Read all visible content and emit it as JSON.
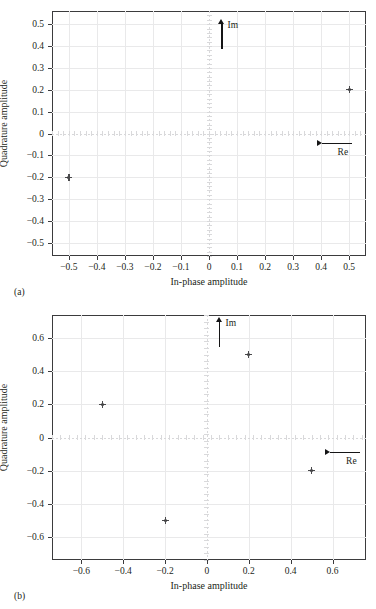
{
  "page": {
    "background": "#ffffff",
    "ink": "#231f20",
    "grid_color": "#e9e9ea",
    "frame_color": "#3b3b3d",
    "marker_color": "#4a4a4c",
    "arrow_color": "#151516"
  },
  "panels": [
    {
      "id": "a",
      "caption": "(a)",
      "xlabel": "In-phase amplitude",
      "ylabel": "Quadrature amplitude",
      "annotations": [
        {
          "label": "Im",
          "direction": "up"
        },
        {
          "label": "Re",
          "direction": "right"
        }
      ]
    },
    {
      "id": "b",
      "caption": "(b)",
      "xlabel": "In-phase amplitude",
      "ylabel": "Quadrature amplitude",
      "annotations": [
        {
          "label": "Im",
          "direction": "up"
        },
        {
          "label": "Re",
          "direction": "right"
        }
      ]
    }
  ],
  "chart_data": [
    {
      "type": "scatter",
      "panel": "a",
      "title": "",
      "xlabel": "In-phase amplitude",
      "ylabel": "Quadrature amplitude",
      "xlim": [
        -0.56,
        0.56
      ],
      "ylim": [
        -0.56,
        0.56
      ],
      "xticks": [
        -0.5,
        -0.4,
        -0.3,
        -0.2,
        -0.1,
        0,
        0.1,
        0.2,
        0.3,
        0.4,
        0.5
      ],
      "yticks": [
        -0.5,
        -0.4,
        -0.3,
        -0.2,
        -0.1,
        0,
        0.1,
        0.2,
        0.3,
        0.4,
        0.5
      ],
      "xticklabels": [
        "−0.5",
        "−0.4",
        "−0.3",
        "−0.2",
        "−0.1",
        "0",
        "0.1",
        "0.2",
        "0.3",
        "0.4",
        "0.5"
      ],
      "yticklabels": [
        "−0.5",
        "−0.4",
        "−0.3",
        "−0.2",
        "−0.1",
        "0",
        "0.1",
        "0.2",
        "0.3",
        "0.4",
        "0.5"
      ],
      "grid": true,
      "legend": "none",
      "marker": "plus",
      "points": [
        {
          "x": -0.5,
          "y": -0.2
        },
        {
          "x": 0.5,
          "y": 0.2
        }
      ],
      "annotations": [
        {
          "text": "Im",
          "x": 0.045,
          "y": 0.455,
          "direction": "up"
        },
        {
          "text": "Re",
          "x": 0.455,
          "y": -0.045,
          "direction": "right"
        }
      ]
    },
    {
      "type": "scatter",
      "panel": "b",
      "title": "",
      "xlabel": "In-phase amplitude",
      "ylabel": "Quadrature amplitude",
      "xlim": [
        -0.74,
        0.76
      ],
      "ylim": [
        -0.74,
        0.74
      ],
      "xticks": [
        -0.6,
        -0.4,
        -0.2,
        0,
        0.2,
        0.4,
        0.6
      ],
      "yticks": [
        -0.6,
        -0.4,
        -0.2,
        0,
        0.2,
        0.4,
        0.6
      ],
      "xticklabels": [
        "−0.6",
        "−0.4",
        "−0.2",
        "0",
        "0.2",
        "0.4",
        "0.6"
      ],
      "yticklabels": [
        "−0.6",
        "−0.4",
        "−0.2",
        "0",
        "0.2",
        "0.4",
        "0.6"
      ],
      "grid": true,
      "legend": "none",
      "marker": "plus",
      "points": [
        {
          "x": -0.5,
          "y": 0.2
        },
        {
          "x": 0.2,
          "y": 0.5
        },
        {
          "x": 0.5,
          "y": -0.2
        },
        {
          "x": -0.2,
          "y": -0.5
        }
      ],
      "annotations": [
        {
          "text": "Im",
          "x": 0.06,
          "y": 0.64,
          "direction": "up"
        },
        {
          "text": "Re",
          "x": 0.66,
          "y": -0.09,
          "direction": "right"
        }
      ]
    }
  ]
}
